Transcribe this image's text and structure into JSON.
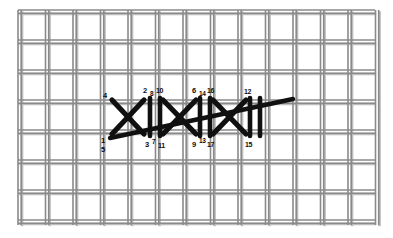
{
  "figure": {
    "kind": "needlework-stitch-diagram",
    "substrate": "woven canvas mesh",
    "background_color": "#ffffff",
    "mesh_color": "#8a8a8a",
    "mesh_shadow_color": "#bdbdbd",
    "stitch_color": "#101010",
    "label_color": "#0d0d0d",
    "mesh": {
      "area": {
        "x": 18,
        "y": 10,
        "width": 357,
        "height": 215
      },
      "column_pitch": 27.5,
      "row_pitch": 30.0,
      "thread_pair_gap": 3.2,
      "thread_width": 1.6
    }
  },
  "stitch_labels": [
    {
      "text": "4",
      "x": 103,
      "y": 92,
      "size": 7.5
    },
    {
      "text": "2",
      "x": 143,
      "y": 87,
      "size": 7.5
    },
    {
      "text": "8",
      "x": 150,
      "y": 91,
      "size": 6.5
    },
    {
      "text": "10",
      "x": 156,
      "y": 87,
      "size": 7.0
    },
    {
      "text": "6",
      "x": 192,
      "y": 87,
      "size": 7.5
    },
    {
      "text": "14",
      "x": 199,
      "y": 91,
      "size": 6.5
    },
    {
      "text": "16",
      "x": 207,
      "y": 87,
      "size": 7.0
    },
    {
      "text": "12",
      "x": 244,
      "y": 88,
      "size": 7.0
    },
    {
      "text": "1",
      "x": 101,
      "y": 137,
      "size": 7.5
    },
    {
      "text": "5",
      "x": 101,
      "y": 146,
      "size": 7.5
    },
    {
      "text": "3",
      "x": 145,
      "y": 141,
      "size": 7.5
    },
    {
      "text": "7",
      "x": 152,
      "y": 139,
      "size": 6.5
    },
    {
      "text": "11",
      "x": 158,
      "y": 142,
      "size": 7.0
    },
    {
      "text": "9",
      "x": 192,
      "y": 141,
      "size": 7.5
    },
    {
      "text": "13",
      "x": 199,
      "y": 138,
      "size": 6.5
    },
    {
      "text": "17",
      "x": 207,
      "y": 141,
      "size": 7.0
    },
    {
      "text": "15",
      "x": 245,
      "y": 141,
      "size": 7.0
    }
  ],
  "stitch_strokes": [
    {
      "name": "cross-a-down",
      "x1": 112,
      "y1": 100,
      "x2": 144,
      "y2": 134,
      "w": 5.2
    },
    {
      "name": "cross-a-up",
      "x1": 112,
      "y1": 134,
      "x2": 144,
      "y2": 100,
      "w": 5.2
    },
    {
      "name": "upright-a-l",
      "x1": 150,
      "y1": 98,
      "x2": 150,
      "y2": 136,
      "w": 4.6
    },
    {
      "name": "upright-a-r",
      "x1": 160,
      "y1": 98,
      "x2": 160,
      "y2": 136,
      "w": 4.6
    },
    {
      "name": "cross-b-down",
      "x1": 163,
      "y1": 100,
      "x2": 196,
      "y2": 134,
      "w": 5.2
    },
    {
      "name": "cross-b-up",
      "x1": 163,
      "y1": 134,
      "x2": 196,
      "y2": 100,
      "w": 5.2
    },
    {
      "name": "upright-b-l",
      "x1": 200,
      "y1": 98,
      "x2": 200,
      "y2": 136,
      "w": 4.6
    },
    {
      "name": "upright-b-r",
      "x1": 210,
      "y1": 98,
      "x2": 210,
      "y2": 136,
      "w": 4.6
    },
    {
      "name": "cross-c-down",
      "x1": 213,
      "y1": 100,
      "x2": 246,
      "y2": 134,
      "w": 5.2
    },
    {
      "name": "cross-c-up",
      "x1": 213,
      "y1": 134,
      "x2": 246,
      "y2": 100,
      "w": 5.2
    },
    {
      "name": "upright-c-l",
      "x1": 250,
      "y1": 98,
      "x2": 250,
      "y2": 136,
      "w": 4.6
    },
    {
      "name": "upright-c-r",
      "x1": 260,
      "y1": 98,
      "x2": 260,
      "y2": 136,
      "w": 4.6
    },
    {
      "name": "long-diagonal",
      "x1": 110,
      "y1": 138,
      "x2": 293,
      "y2": 99,
      "w": 4.4
    }
  ]
}
